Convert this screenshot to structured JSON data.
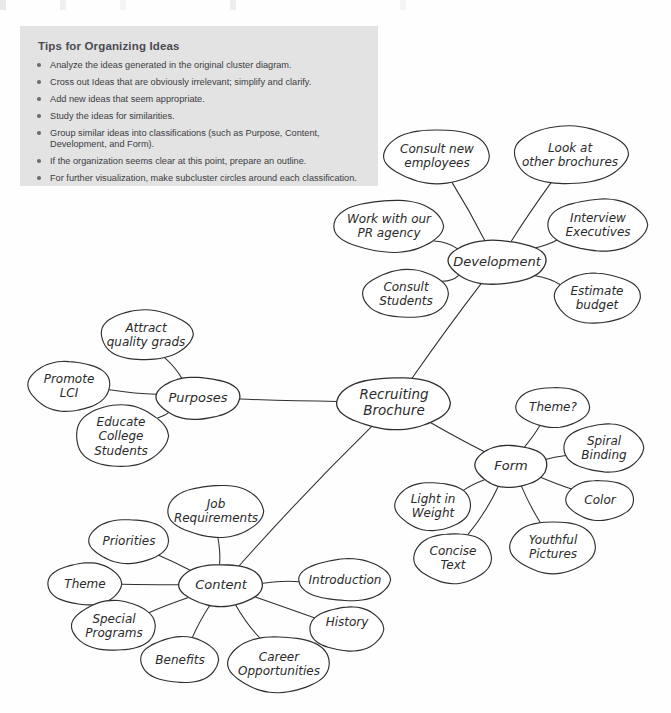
{
  "page": {
    "background": "#fefefe",
    "ink_color": "#2a2a2a"
  },
  "tips": {
    "title": "Tips for Organizing Ideas",
    "background": "#e3e3e3",
    "items": [
      "Analyze the ideas generated in the original cluster diagram.",
      "Cross out Ideas that are obviously irrelevant; simplify and clarify.",
      "Add new ideas that seem appropriate.",
      "Study the ideas for similarities.",
      "Group similar ideas into classifications (such as Purpose, Content, Development, and Form).",
      "If the organization seems clear at this point, prepare an outline.",
      "For further visualization, make subcluster circles around each classification."
    ]
  },
  "diagram": {
    "type": "cluster-mind-map",
    "center": {
      "id": "center",
      "label": "Recruiting Brochure",
      "lines": [
        "Recruiting",
        "Brochure"
      ],
      "cx": 394,
      "cy": 403,
      "rx": 57,
      "ry": 26
    },
    "hubs": [
      {
        "id": "development",
        "label": "Development",
        "lines": [
          "Development"
        ],
        "cx": 497,
        "cy": 262,
        "rx": 49,
        "ry": 22
      },
      {
        "id": "purposes",
        "label": "Purposes",
        "lines": [
          "Purposes"
        ],
        "cx": 198,
        "cy": 398,
        "rx": 42,
        "ry": 21
      },
      {
        "id": "form",
        "label": "Form",
        "lines": [
          "Form"
        ],
        "cx": 511,
        "cy": 466,
        "rx": 36,
        "ry": 21
      },
      {
        "id": "content",
        "label": "Content",
        "lines": [
          "Content"
        ],
        "cx": 221,
        "cy": 585,
        "rx": 42,
        "ry": 21
      }
    ],
    "leaves": [
      {
        "id": "consult-new-employees",
        "hub": "development",
        "label": "Consult new employees",
        "lines": [
          "Consult new",
          "employees"
        ],
        "cx": 437,
        "cy": 156,
        "rx": 53,
        "ry": 27
      },
      {
        "id": "look-at-other-brochures",
        "hub": "development",
        "label": "Look at other brochures",
        "lines": [
          "Look at",
          "other brochures"
        ],
        "cx": 570,
        "cy": 155,
        "rx": 57,
        "ry": 29
      },
      {
        "id": "work-with-our-pr-agency",
        "hub": "development",
        "label": "Work with our PR agency",
        "lines": [
          "Work with our",
          "PR agency"
        ],
        "cx": 389,
        "cy": 226,
        "rx": 55,
        "ry": 26
      },
      {
        "id": "interview-executives",
        "hub": "development",
        "label": "Interview Executives",
        "lines": [
          "Interview",
          "Executives"
        ],
        "cx": 598,
        "cy": 225,
        "rx": 50,
        "ry": 26
      },
      {
        "id": "consult-students",
        "hub": "development",
        "label": "Consult Students",
        "lines": [
          "Consult",
          "Students"
        ],
        "cx": 406,
        "cy": 294,
        "rx": 43,
        "ry": 24
      },
      {
        "id": "estimate-budget",
        "hub": "development",
        "label": "Estimate budget",
        "lines": [
          "Estimate",
          "budget"
        ],
        "cx": 597,
        "cy": 298,
        "rx": 43,
        "ry": 25
      },
      {
        "id": "attract-quality-grads",
        "hub": "purposes",
        "label": "Attract quality grads",
        "lines": [
          "Attract",
          "quality grads"
        ],
        "cx": 146,
        "cy": 335,
        "rx": 46,
        "ry": 25
      },
      {
        "id": "promote-lci",
        "hub": "purposes",
        "label": "Promote LCI",
        "lines": [
          "Promote",
          "LCI"
        ],
        "cx": 69,
        "cy": 386,
        "rx": 41,
        "ry": 25
      },
      {
        "id": "educate-college-students",
        "hub": "purposes",
        "label": "Educate College Students",
        "lines": [
          "Educate",
          "College",
          "Students"
        ],
        "cx": 121,
        "cy": 436,
        "rx": 46,
        "ry": 31
      },
      {
        "id": "theme-q",
        "hub": "form",
        "label": "Theme?",
        "lines": [
          "Theme?"
        ],
        "cx": 553,
        "cy": 407,
        "rx": 37,
        "ry": 20
      },
      {
        "id": "spiral-binding",
        "hub": "form",
        "label": "Spiral Binding",
        "lines": [
          "Spiral",
          "Binding"
        ],
        "cx": 604,
        "cy": 448,
        "rx": 40,
        "ry": 24
      },
      {
        "id": "color",
        "hub": "form",
        "label": "Color",
        "lines": [
          "Color"
        ],
        "cx": 600,
        "cy": 500,
        "rx": 34,
        "ry": 20
      },
      {
        "id": "light-in-weight",
        "hub": "form",
        "label": "Light in Weight",
        "lines": [
          "Light in",
          "Weight"
        ],
        "cx": 433,
        "cy": 506,
        "rx": 38,
        "ry": 24
      },
      {
        "id": "concise-text",
        "hub": "form",
        "label": "Concise Text",
        "lines": [
          "Concise",
          "Text"
        ],
        "cx": 453,
        "cy": 558,
        "rx": 39,
        "ry": 25
      },
      {
        "id": "youthful-pictures",
        "hub": "form",
        "label": "Youthful Pictures",
        "lines": [
          "Youthful",
          "Pictures"
        ],
        "cx": 553,
        "cy": 547,
        "rx": 43,
        "ry": 26
      },
      {
        "id": "job-requirements",
        "hub": "content",
        "label": "Job Requirements",
        "lines": [
          "Job",
          "Requirements"
        ],
        "cx": 216,
        "cy": 511,
        "rx": 48,
        "ry": 26
      },
      {
        "id": "priorities",
        "hub": "content",
        "label": "Priorities",
        "lines": [
          "Priorities"
        ],
        "cx": 129,
        "cy": 541,
        "rx": 40,
        "ry": 22
      },
      {
        "id": "theme",
        "hub": "content",
        "label": "Theme",
        "lines": [
          "Theme"
        ],
        "cx": 85,
        "cy": 584,
        "rx": 37,
        "ry": 21
      },
      {
        "id": "special-programs",
        "hub": "content",
        "label": "Special Programs",
        "lines": [
          "Special",
          "Programs"
        ],
        "cx": 114,
        "cy": 626,
        "rx": 42,
        "ry": 25
      },
      {
        "id": "benefits",
        "hub": "content",
        "label": "Benefits",
        "lines": [
          "Benefits"
        ],
        "cx": 180,
        "cy": 660,
        "rx": 39,
        "ry": 23
      },
      {
        "id": "career-opportunities",
        "hub": "content",
        "label": "Career Opportunities",
        "lines": [
          "Career",
          "Opportunities"
        ],
        "cx": 279,
        "cy": 664,
        "rx": 51,
        "ry": 28
      },
      {
        "id": "history",
        "hub": "content",
        "label": "History",
        "lines": [
          "History",
          ""
        ],
        "cx": 347,
        "cy": 629,
        "rx": 37,
        "ry": 22
      },
      {
        "id": "introduction",
        "hub": "content",
        "label": "Introduction",
        "lines": [
          "Introduction"
        ],
        "cx": 345,
        "cy": 580,
        "rx": 46,
        "ry": 21
      }
    ]
  }
}
